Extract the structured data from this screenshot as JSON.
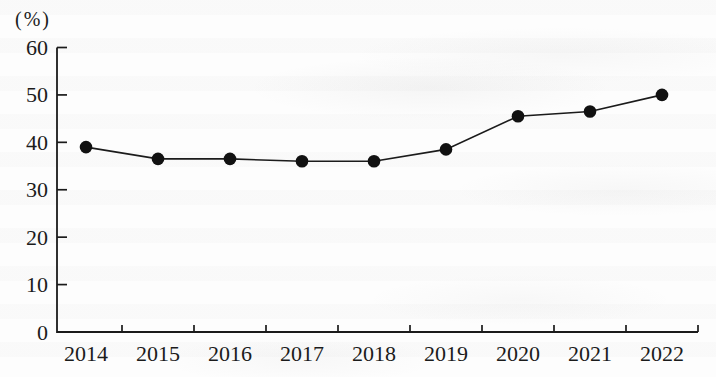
{
  "chart_data": {
    "type": "line",
    "title": "",
    "unit_label": "(%)",
    "xlabel": "",
    "ylabel": "(%)",
    "categories": [
      "2014",
      "2015",
      "2016",
      "2017",
      "2018",
      "2019",
      "2020",
      "2021",
      "2022"
    ],
    "series": [
      {
        "name": "percentage",
        "values": [
          39,
          36.5,
          36.5,
          36,
          36,
          38.5,
          45.5,
          46.5,
          50
        ]
      }
    ],
    "ylim": [
      0,
      60
    ],
    "yticks": [
      0,
      10,
      20,
      30,
      40,
      50,
      60
    ],
    "grid": false,
    "legend": "none",
    "marker": "filled-circle",
    "line_color": "#1b1b1b",
    "marker_color": "#111111",
    "background": "#fdfdfd"
  }
}
